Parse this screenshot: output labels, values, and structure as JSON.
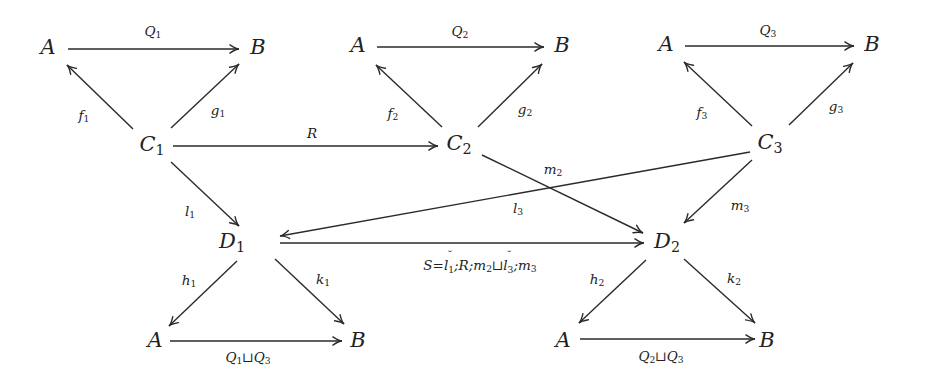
{
  "diagram": {
    "type": "commutative-diagram",
    "nodes": [
      {
        "id": "A_t1",
        "name": "A",
        "sub": "",
        "x": 48,
        "y": 47
      },
      {
        "id": "B_t1",
        "name": "B",
        "sub": "",
        "x": 258,
        "y": 47
      },
      {
        "id": "C1",
        "name": "C",
        "sub": "1",
        "x": 152,
        "y": 146
      },
      {
        "id": "A_t2",
        "name": "A",
        "sub": "",
        "x": 358,
        "y": 45
      },
      {
        "id": "B_t2",
        "name": "B",
        "sub": "",
        "x": 562,
        "y": 45
      },
      {
        "id": "C2",
        "name": "C",
        "sub": "2",
        "x": 459,
        "y": 145
      },
      {
        "id": "A_t3",
        "name": "A",
        "sub": "",
        "x": 666,
        "y": 44
      },
      {
        "id": "B_t3",
        "name": "B",
        "sub": "",
        "x": 872,
        "y": 44
      },
      {
        "id": "C3",
        "name": "C",
        "sub": "3",
        "x": 770,
        "y": 144
      },
      {
        "id": "D1",
        "name": "D",
        "sub": "1",
        "x": 232,
        "y": 243
      },
      {
        "id": "D2",
        "name": "D",
        "sub": "2",
        "x": 667,
        "y": 243
      },
      {
        "id": "A_b1",
        "name": "A",
        "sub": "",
        "x": 155,
        "y": 340
      },
      {
        "id": "B_b1",
        "name": "B",
        "sub": "",
        "x": 358,
        "y": 340
      },
      {
        "id": "A_b2",
        "name": "A",
        "sub": "",
        "x": 563,
        "y": 340
      },
      {
        "id": "B_b2",
        "name": "B",
        "sub": "",
        "x": 767,
        "y": 340
      }
    ],
    "edges": [
      {
        "id": "Q1",
        "from": "A_t1",
        "to": "B_t1",
        "label": "Q",
        "label_sub": "1",
        "label_x": 153,
        "label_y": 32,
        "x1": 68,
        "y1": 49,
        "x2": 239,
        "y2": 49
      },
      {
        "id": "f1",
        "from": "C1",
        "to": "A_t1",
        "label": "f",
        "label_sub": "1",
        "label_x": 84,
        "label_y": 116,
        "x1": 133,
        "y1": 129,
        "x2": 67,
        "y2": 65
      },
      {
        "id": "g1",
        "from": "C1",
        "to": "B_t1",
        "label": "g",
        "label_sub": "1",
        "label_x": 218,
        "label_y": 111,
        "x1": 171,
        "y1": 128,
        "x2": 239,
        "y2": 64
      },
      {
        "id": "R",
        "from": "C1",
        "to": "C2",
        "label": "R",
        "label_sub": "",
        "label_x": 312,
        "label_y": 134,
        "x1": 173,
        "y1": 146,
        "x2": 438,
        "y2": 146
      },
      {
        "id": "Q2",
        "from": "A_t2",
        "to": "B_t2",
        "label": "Q",
        "label_sub": "2",
        "label_x": 460,
        "label_y": 32,
        "x1": 377,
        "y1": 47,
        "x2": 544,
        "y2": 47
      },
      {
        "id": "f2",
        "from": "C2",
        "to": "A_t2",
        "label": "f",
        "label_sub": "2",
        "label_x": 393,
        "label_y": 114,
        "x1": 442,
        "y1": 127,
        "x2": 376,
        "y2": 65
      },
      {
        "id": "g2",
        "from": "C2",
        "to": "B_t2",
        "label": "g",
        "label_sub": "2",
        "label_x": 525,
        "label_y": 110,
        "x1": 478,
        "y1": 127,
        "x2": 542,
        "y2": 64
      },
      {
        "id": "Q3",
        "from": "A_t3",
        "to": "B_t3",
        "label": "Q",
        "label_sub": "3",
        "label_x": 768,
        "label_y": 31,
        "x1": 685,
        "y1": 46,
        "x2": 854,
        "y2": 46
      },
      {
        "id": "f3",
        "from": "C3",
        "to": "A_t3",
        "label": "f",
        "label_sub": "3",
        "label_x": 702,
        "label_y": 113,
        "x1": 752,
        "y1": 126,
        "x2": 684,
        "y2": 62
      },
      {
        "id": "g3",
        "from": "C3",
        "to": "B_t3",
        "label": "g",
        "label_sub": "3",
        "label_x": 836,
        "label_y": 107,
        "x1": 789,
        "y1": 125,
        "x2": 853,
        "y2": 63
      },
      {
        "id": "l1",
        "from": "C1",
        "to": "D1",
        "label": "l",
        "label_sub": "1",
        "label_x": 190,
        "label_y": 212,
        "x1": 171,
        "y1": 162,
        "x2": 239,
        "y2": 226
      },
      {
        "id": "m2",
        "from": "C2",
        "to": "D2",
        "label": "m",
        "label_sub": "2",
        "label_x": 553,
        "label_y": 170,
        "x1": 482,
        "y1": 155,
        "x2": 643,
        "y2": 233
      },
      {
        "id": "l3",
        "from": "C3",
        "to": "D1",
        "label": "l",
        "label_sub": "3",
        "label_x": 518,
        "label_y": 209,
        "x1": 750,
        "y1": 152,
        "x2": 280,
        "y2": 236
      },
      {
        "id": "m3",
        "from": "C3",
        "to": "D2",
        "label": "m",
        "label_sub": "3",
        "label_x": 740,
        "label_y": 206,
        "x1": 752,
        "y1": 160,
        "x2": 684,
        "y2": 223
      },
      {
        "id": "S",
        "from": "D1",
        "to": "D2",
        "label": "S=l₁˘;R;m₂⊔l₃˘;m₃",
        "label_sub": "",
        "label_x": 480,
        "label_y": 266,
        "x1": 280,
        "y1": 243,
        "x2": 644,
        "y2": 243
      },
      {
        "id": "h1",
        "from": "D1",
        "to": "A_b1",
        "label": "h",
        "label_sub": "1",
        "label_x": 189,
        "label_y": 281,
        "x1": 237,
        "y1": 261,
        "x2": 169,
        "y2": 326
      },
      {
        "id": "k1",
        "from": "D1",
        "to": "B_b1",
        "label": "k",
        "label_sub": "1",
        "label_x": 323,
        "label_y": 280,
        "x1": 275,
        "y1": 259,
        "x2": 344,
        "y2": 324
      },
      {
        "id": "Q1uQ3",
        "from": "A_b1",
        "to": "B_b1",
        "label": "Q₁⊔Q₃",
        "label_sub": "",
        "label_x": 248,
        "label_y": 358,
        "x1": 170,
        "y1": 341,
        "x2": 342,
        "y2": 341
      },
      {
        "id": "h2",
        "from": "D2",
        "to": "A_b2",
        "label": "h",
        "label_sub": "2",
        "label_x": 597,
        "label_y": 280,
        "x1": 646,
        "y1": 260,
        "x2": 579,
        "y2": 323
      },
      {
        "id": "k2",
        "from": "D2",
        "to": "B_b2",
        "label": "k",
        "label_sub": "2",
        "label_x": 734,
        "label_y": 279,
        "x1": 684,
        "y1": 259,
        "x2": 755,
        "y2": 323
      },
      {
        "id": "Q2uQ3",
        "from": "A_b2",
        "to": "B_b2",
        "label": "Q₂⊔Q₃",
        "label_sub": "",
        "label_x": 661,
        "label_y": 357,
        "x1": 580,
        "y1": 339,
        "x2": 755,
        "y2": 339
      }
    ],
    "labels": {
      "S_label": {
        "S": "S",
        "eq": "=",
        "l": "l",
        "l_sub": "1",
        "conv": "˘",
        "rest1": ";R;m",
        "m_sub": "2",
        "join": "⊔",
        "l3": "l",
        "l3_sub": "3",
        "conv2": "˘",
        "rest2": ";m",
        "m3_sub": "3"
      },
      "Q1uQ3": {
        "q1": "Q",
        "s1": "1",
        "join": "⊔",
        "q2": "Q",
        "s2": "3"
      },
      "Q2uQ3": {
        "q1": "Q",
        "s1": "2",
        "join": "⊔",
        "q2": "Q",
        "s2": "3"
      }
    },
    "colors": {
      "line": "#2a2a2a",
      "text": "#222222",
      "background": "#ffffff"
    }
  }
}
